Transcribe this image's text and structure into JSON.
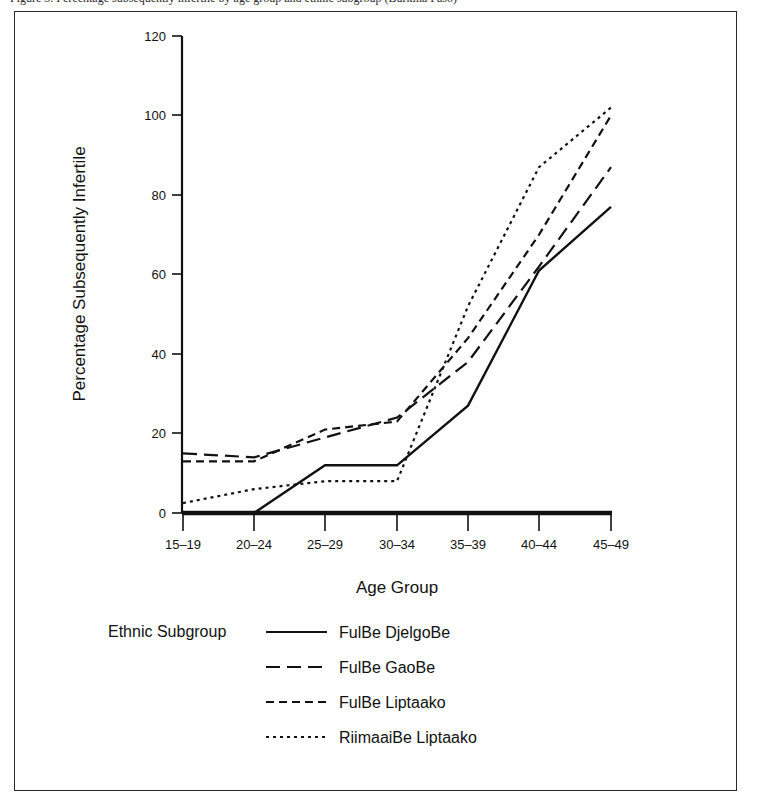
{
  "caption": {
    "text": "Figure 3.  Percentage subsequently infertile by age group and ethnic subgroup (Burkina Faso)"
  },
  "chart_data": {
    "type": "line",
    "title": "",
    "xlabel": "Age Group",
    "ylabel": "Percentage Subsequently Infertile",
    "categories": [
      "15–19",
      "20–24",
      "25–29",
      "30–34",
      "35–39",
      "40–44",
      "45–49"
    ],
    "ylim": [
      0,
      120
    ],
    "yticks": [
      0,
      20,
      40,
      60,
      80,
      100,
      120
    ],
    "grid": false,
    "legend_title": "Ethnic Subgroup",
    "legend_position": "below-axis",
    "series": [
      {
        "name": "FulBe DjelgoBe",
        "dash": "solid",
        "dasharray": "none",
        "color": "#111111",
        "values": [
          null,
          0,
          12,
          12,
          27,
          61,
          77
        ]
      },
      {
        "name": "FulBe GaoBe",
        "dash": "long-dash",
        "dasharray": "14,7",
        "color": "#111111",
        "values": [
          15,
          14,
          19,
          24,
          38,
          62,
          87
        ]
      },
      {
        "name": "FulBe Liptaako",
        "dash": "medium-dash",
        "dasharray": "8,5",
        "color": "#111111",
        "values": [
          13,
          13,
          21,
          23,
          44,
          70,
          100
        ]
      },
      {
        "name": "RiimaaiBe Liptaako",
        "dash": "dotted",
        "dasharray": "3,4",
        "color": "#111111",
        "values": [
          2.5,
          6,
          8,
          8,
          52,
          87,
          102
        ]
      }
    ]
  },
  "legend": {
    "title": "Ethnic Subgroup",
    "entries": [
      {
        "label": "FulBe DjelgoBe",
        "sample": "solid-line-sample"
      },
      {
        "label": "FulBe GaoBe",
        "sample": "long-dash-line-sample"
      },
      {
        "label": "FulBe Liptaako",
        "sample": "medium-dash-line-sample"
      },
      {
        "label": "RiimaaiBe Liptaako",
        "sample": "dotted-line-sample"
      }
    ]
  },
  "axes": {
    "y_title": "Percentage Subsequently Infertile",
    "x_title": "Age Group",
    "ytick_labels": [
      "0",
      "20",
      "40",
      "60",
      "80",
      "100",
      "120"
    ],
    "xtick_labels": [
      "15–19",
      "20–24",
      "25–29",
      "30–34",
      "35–39",
      "40–44",
      "45–49"
    ]
  },
  "colors": {
    "ink": "#111111",
    "frame": "#2a2a2a",
    "background": "#ffffff"
  }
}
